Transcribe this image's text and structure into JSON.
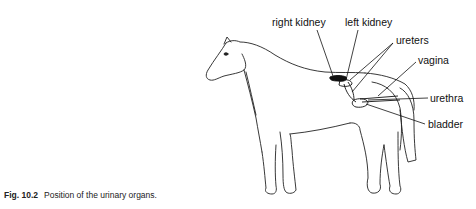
{
  "figure": {
    "labels": {
      "right_kidney": "right kidney",
      "left_kidney": "left kidney",
      "ureters": "ureters",
      "vagina": "vagina",
      "urethra": "urethra",
      "bladder": "bladder"
    },
    "caption": {
      "number": "Fig. 10.2",
      "text": "Position of the urinary organs."
    }
  }
}
